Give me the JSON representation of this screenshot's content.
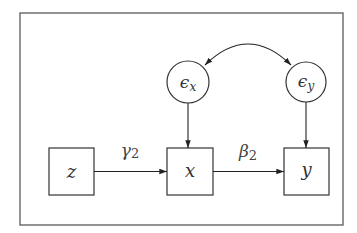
{
  "diagram": {
    "type": "path-diagram",
    "colors": {
      "stroke": "#333333",
      "frame": "#555555",
      "background": "#ffffff"
    },
    "nodes": {
      "z": {
        "shape": "square",
        "label": "z"
      },
      "x": {
        "shape": "square",
        "label": "x"
      },
      "y": {
        "shape": "square",
        "label": "y"
      },
      "eps_x": {
        "shape": "circle",
        "symbol": "ϵ",
        "subscript": "x"
      },
      "eps_y": {
        "shape": "circle",
        "symbol": "ϵ",
        "subscript": "y"
      }
    },
    "edges": [
      {
        "from": "z",
        "to": "x",
        "label_symbol": "γ",
        "label_subscript": "2",
        "style": "directed"
      },
      {
        "from": "x",
        "to": "y",
        "label_symbol": "β",
        "label_subscript": "2",
        "style": "directed"
      },
      {
        "from": "eps_x",
        "to": "x",
        "style": "directed"
      },
      {
        "from": "eps_y",
        "to": "y",
        "style": "directed"
      },
      {
        "from": "eps_x",
        "to": "eps_y",
        "style": "curved-bidirectional"
      }
    ]
  }
}
